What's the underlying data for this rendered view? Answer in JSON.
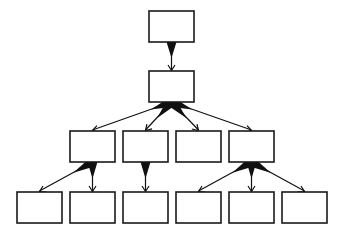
{
  "diagram": {
    "type": "tree-hierarchy",
    "colors": {
      "background": "#ffffff",
      "stroke": "#1a1a1a",
      "edge": "#111111",
      "node_fill": "#ffffff"
    },
    "node_size": {
      "w": 45,
      "h": 31
    },
    "nodes": [
      {
        "id": "n0",
        "level": 0,
        "x": 149,
        "y": 11,
        "label": ""
      },
      {
        "id": "n1",
        "level": 1,
        "x": 149,
        "y": 71,
        "label": ""
      },
      {
        "id": "n2a",
        "level": 2,
        "x": 70,
        "y": 131,
        "label": ""
      },
      {
        "id": "n2b",
        "level": 2,
        "x": 123,
        "y": 131,
        "label": ""
      },
      {
        "id": "n2c",
        "level": 2,
        "x": 176,
        "y": 131,
        "label": ""
      },
      {
        "id": "n2d",
        "level": 2,
        "x": 229,
        "y": 131,
        "label": ""
      },
      {
        "id": "n3a",
        "level": 3,
        "x": 17,
        "y": 192,
        "label": ""
      },
      {
        "id": "n3b",
        "level": 3,
        "x": 70,
        "y": 192,
        "label": ""
      },
      {
        "id": "n3c",
        "level": 3,
        "x": 123,
        "y": 192,
        "label": ""
      },
      {
        "id": "n3d",
        "level": 3,
        "x": 176,
        "y": 192,
        "label": ""
      },
      {
        "id": "n3e",
        "level": 3,
        "x": 229,
        "y": 192,
        "label": ""
      },
      {
        "id": "n3f",
        "level": 3,
        "x": 282,
        "y": 192,
        "label": ""
      }
    ],
    "edges": [
      {
        "from": "n0",
        "to": "n1"
      },
      {
        "from": "n1",
        "to": "n2a"
      },
      {
        "from": "n1",
        "to": "n2b"
      },
      {
        "from": "n1",
        "to": "n2c"
      },
      {
        "from": "n1",
        "to": "n2d"
      },
      {
        "from": "n2a",
        "to": "n3a"
      },
      {
        "from": "n2a",
        "to": "n3b"
      },
      {
        "from": "n2b",
        "to": "n3c"
      },
      {
        "from": "n2d",
        "to": "n3d"
      },
      {
        "from": "n2d",
        "to": "n3e"
      },
      {
        "from": "n2d",
        "to": "n3f"
      }
    ]
  }
}
